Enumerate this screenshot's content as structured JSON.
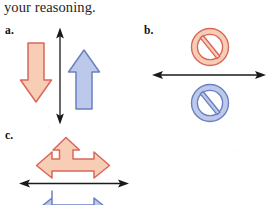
{
  "page": {
    "background_color": "#ffffff",
    "prompt_text": "your reasoning."
  },
  "colors": {
    "salmon_fill": "#f8cdb6",
    "salmon_stroke": "#d9675a",
    "blue_fill": "#bdc9ea",
    "blue_stroke": "#6b80c0",
    "axis_black": "#1a1a1a",
    "text_black": "#242424"
  },
  "parts": [
    {
      "id": "a",
      "label": "a.",
      "axis": {
        "orientation": "vertical",
        "double_headed": true,
        "color": "#1a1a1a"
      },
      "vectors": [
        {
          "name": "salmon-down-arrow",
          "color_name": "salmon",
          "direction": "down",
          "side": "left-of-axis",
          "fill": "#f8cdb6",
          "stroke": "#d9675a"
        },
        {
          "name": "blue-up-arrow",
          "color_name": "blue",
          "direction": "up",
          "side": "right-of-axis",
          "fill": "#bdc9ea",
          "stroke": "#6b80c0"
        }
      ]
    },
    {
      "id": "b",
      "label": "b.",
      "axis": {
        "orientation": "horizontal",
        "double_headed": true,
        "color": "#1a1a1a"
      },
      "vectors": [
        {
          "name": "salmon-no-symbol",
          "color_name": "salmon",
          "direction": "none",
          "side": "above-axis",
          "symbol": "prohibition-circle-slash",
          "fill": "#f8cdb6",
          "stroke": "#d9675a"
        },
        {
          "name": "blue-no-symbol",
          "color_name": "blue",
          "direction": "none",
          "side": "below-axis",
          "symbol": "prohibition-circle-slash",
          "fill": "#bdc9ea",
          "stroke": "#6b80c0"
        }
      ]
    },
    {
      "id": "c",
      "label": "c.",
      "axis": {
        "orientation": "horizontal",
        "double_headed": true,
        "color": "#1a1a1a"
      },
      "vectors": [
        {
          "name": "salmon-tee-arrow",
          "color_name": "salmon",
          "direction": "up-left-right",
          "side": "above-axis",
          "fill": "#f8cdb6",
          "stroke": "#d9675a"
        },
        {
          "name": "blue-tee-arrow",
          "color_name": "blue",
          "direction": "down-left-right",
          "side": "below-axis",
          "cropped": "bottom",
          "fill": "#bdc9ea",
          "stroke": "#6b80c0"
        }
      ]
    }
  ]
}
